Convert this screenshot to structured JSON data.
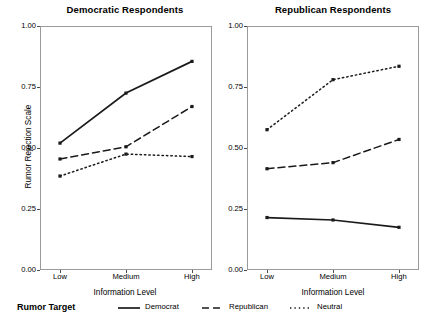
{
  "chart_data": {
    "type": "line",
    "title": "",
    "xlabel": "Information Level",
    "ylabel": "Rumor Rejection Scale",
    "categories": [
      "Low",
      "Medium",
      "High"
    ],
    "ylim": [
      0.0,
      1.0
    ],
    "yticks": [
      "0.00",
      "0.25",
      "0.50",
      "0.75",
      "1.00"
    ],
    "ytick_values": [
      0.0,
      0.25,
      0.5,
      0.75,
      1.0
    ],
    "grid": false,
    "legend_position": "bottom",
    "legend_title": "Rumor Target",
    "panels": [
      {
        "title": "Democratic Respondents",
        "series": [
          {
            "name": "Democrat",
            "linestyle": "solid",
            "values": [
              0.52,
              0.725,
              0.855
            ]
          },
          {
            "name": "Republican",
            "linestyle": "dashed",
            "values": [
              0.455,
              0.505,
              0.67
            ]
          },
          {
            "name": "Neutral",
            "linestyle": "dotted",
            "values": [
              0.385,
              0.475,
              0.465
            ]
          }
        ]
      },
      {
        "title": "Republican Respondents",
        "series": [
          {
            "name": "Democrat",
            "linestyle": "solid",
            "values": [
              0.215,
              0.205,
              0.175
            ]
          },
          {
            "name": "Republican",
            "linestyle": "dashed",
            "values": [
              0.415,
              0.44,
              0.535
            ]
          },
          {
            "name": "Neutral",
            "linestyle": "dotted",
            "values": [
              0.575,
              0.78,
              0.835
            ]
          }
        ]
      }
    ],
    "legend": [
      {
        "label": "Democrat",
        "linestyle": "solid"
      },
      {
        "label": "Republican",
        "linestyle": "dashed"
      },
      {
        "label": "Neutral",
        "linestyle": "dotted"
      }
    ],
    "line_color": "#1a1a1a"
  }
}
